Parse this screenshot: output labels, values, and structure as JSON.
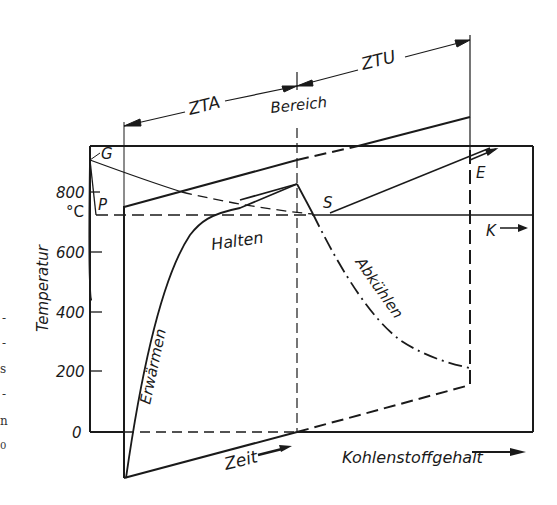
{
  "figure": {
    "type": "diagram",
    "y_axis": {
      "label": "Temperatur",
      "unit": "°C",
      "ticks": [
        "800",
        "600",
        "400",
        "200",
        "0"
      ]
    },
    "x_axis_time": {
      "label": "Zeit"
    },
    "x_axis_carbon": {
      "label": "Kohlenstoffgehalt"
    },
    "regions": {
      "zta": "ZTA",
      "bereich": "Bereich",
      "ztu": "ZTU"
    },
    "curves": {
      "heating": "Erwärmen",
      "holding": "Halten",
      "cooling": "Abkühlen"
    },
    "points": {
      "g": "G",
      "p": "P",
      "s": "S",
      "e": "E",
      "k": "K"
    },
    "margin_fragments": [
      "-",
      "-",
      "s",
      "-",
      "n",
      "0"
    ]
  },
  "colors": {
    "ink": "#1a1a1a",
    "background": "#ffffff"
  }
}
